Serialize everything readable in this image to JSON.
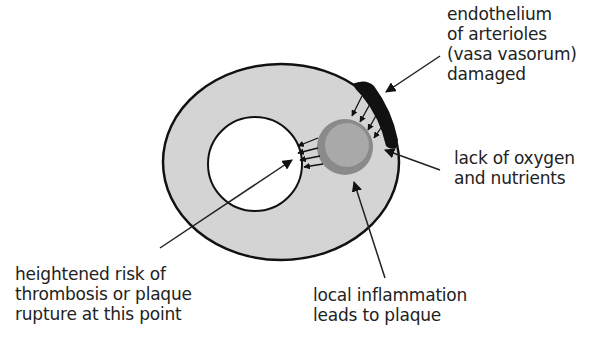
{
  "diagram": {
    "colors": {
      "wall": "#d4d4d4",
      "lumen": "#ffffff",
      "plaque_ring": "#8a8a8a",
      "plaque_core": "#a9a9a9",
      "damaged_endothelium": "#111111",
      "outline": "#111111"
    },
    "labels": {
      "endothelium": {
        "lines": [
          "endothelium",
          "of arterioles",
          "(vasa vasorum)",
          "damaged"
        ]
      },
      "oxygen": {
        "lines": [
          "lack of oxygen",
          "and nutrients"
        ]
      },
      "thrombosis": {
        "lines": [
          "heightened risk of",
          "thrombosis or plaque",
          "rupture at this point"
        ]
      },
      "inflammation": {
        "lines": [
          "local inflammation",
          "leads to plaque"
        ]
      }
    }
  }
}
